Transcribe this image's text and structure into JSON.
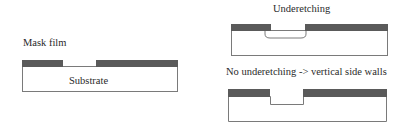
{
  "diagram": {
    "left": {
      "mask_label": "Mask film",
      "substrate_label": "Substrate"
    },
    "top_right": {
      "title": "Underetching"
    },
    "bottom_right": {
      "title": "No underetching -> vertical side walls"
    },
    "colors": {
      "mask": "#5a5a5a",
      "outline": "#7a7a7a",
      "text": "#2a2a2a",
      "background": "#ffffff"
    }
  }
}
